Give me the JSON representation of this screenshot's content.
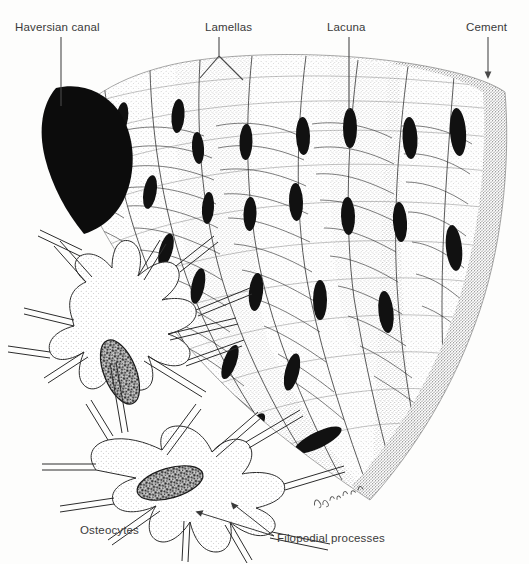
{
  "figure": {
    "background_color": "#fdfdfc",
    "ink_color": "#1a1a1a",
    "label_color": "#3a3a3a"
  },
  "labels": {
    "haversian_canal": "Haversian canal",
    "lamellas": "Lamellas",
    "lacuna": "Lacuna",
    "cement": "Cement",
    "osteocytes": "Osteocytes",
    "filopodial_processes": "Filopodial processes"
  },
  "structures": {
    "haversian_canal": "black fan-shaped central canal at upper left",
    "lamellae_count": 8,
    "lacunae_count": 24,
    "cement_line": "dark stippled arc at outer right margin",
    "osteocyte_count": 2,
    "signature": "artist signature near lower tip"
  }
}
